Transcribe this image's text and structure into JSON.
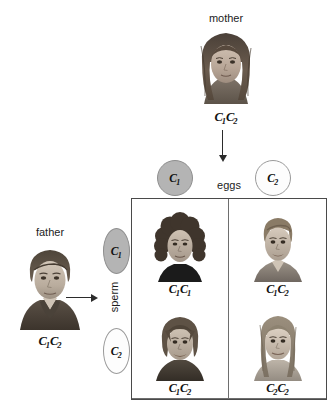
{
  "diagram": {
    "title_mother": "mother",
    "title_father": "father",
    "label_eggs": "eggs",
    "label_sperm": "sperm"
  },
  "parents": {
    "mother": {
      "label": "mother",
      "genotype_allele1": "C",
      "genotype_sub1": "1",
      "genotype_allele2": "C",
      "genotype_sub2": "2"
    },
    "father": {
      "label": "father",
      "genotype_allele1": "C",
      "genotype_sub1": "1",
      "genotype_allele2": "C",
      "genotype_sub2": "2"
    }
  },
  "gametes": {
    "eggs": [
      {
        "allele": "C",
        "sub": "1",
        "fill": "filled",
        "color": "#b4b4b4"
      },
      {
        "allele": "C",
        "sub": "2",
        "fill": "hollow",
        "color": "#fdfdfd"
      }
    ],
    "sperm": [
      {
        "allele": "C",
        "sub": "1",
        "fill": "filled",
        "color": "#b4b4b4"
      },
      {
        "allele": "C",
        "sub": "2",
        "fill": "hollow",
        "color": "#fdfdfd"
      }
    ]
  },
  "punnett": {
    "cells": [
      {
        "allele1": "C",
        "sub1": "1",
        "allele2": "C",
        "sub2": "1",
        "offspring": "curly-haired-child"
      },
      {
        "allele1": "C",
        "sub1": "1",
        "allele2": "C",
        "sub2": "2",
        "offspring": "short-haired-boy"
      },
      {
        "allele1": "C",
        "sub1": "1",
        "allele2": "C",
        "sub2": "2",
        "offspring": "shaggy-haired-boy"
      },
      {
        "allele1": "C",
        "sub1": "2",
        "allele2": "C",
        "sub2": "2",
        "offspring": "long-haired-girl"
      }
    ]
  },
  "colors": {
    "gamete_filled": "#b4b4b4",
    "gamete_hollow": "#fdfdfd",
    "gamete_stroke": "#9a9a9a",
    "grid_outer": "#4a4a4a",
    "grid_inner": "#6e6e6e",
    "arrow": "#2b2b2b",
    "text": "#1c1c1c"
  }
}
